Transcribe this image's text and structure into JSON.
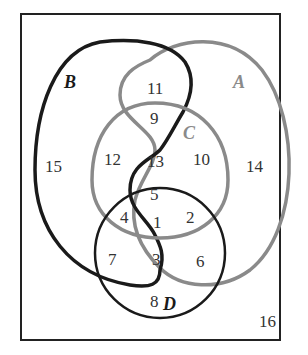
{
  "diagram": {
    "type": "four-set-venn",
    "sets": [
      {
        "name": "A",
        "color": "#8a8a8a"
      },
      {
        "name": "B",
        "color": "#1a1a1a"
      },
      {
        "name": "C",
        "color": "#8a8a8a"
      },
      {
        "name": "D",
        "color": "#1a1a1a"
      }
    ],
    "regions": [
      {
        "label": "1",
        "sets": "A B C D"
      },
      {
        "label": "2",
        "sets": "A C D"
      },
      {
        "label": "3",
        "sets": "A B D"
      },
      {
        "label": "4",
        "sets": "B C D"
      },
      {
        "label": "5",
        "sets": "A B C"
      },
      {
        "label": "6",
        "sets": "A D"
      },
      {
        "label": "7",
        "sets": "B D"
      },
      {
        "label": "8",
        "sets": "D"
      },
      {
        "label": "9",
        "sets": "A B C"
      },
      {
        "label": "10",
        "sets": "A C"
      },
      {
        "label": "11",
        "sets": "A B"
      },
      {
        "label": "12",
        "sets": "B C"
      },
      {
        "label": "13",
        "sets": "B C"
      },
      {
        "label": "14",
        "sets": "A"
      },
      {
        "label": "15",
        "sets": "B"
      },
      {
        "label": "16",
        "sets": "none"
      }
    ]
  },
  "labels": {
    "A": "A",
    "B": "B",
    "C": "C",
    "D": "D",
    "r1": "1",
    "r2": "2",
    "r3": "3",
    "r4": "4",
    "r5": "5",
    "r6": "6",
    "r7": "7",
    "r8": "8",
    "r9": "9",
    "r10": "10",
    "r11": "11",
    "r12": "12",
    "r13": "13",
    "r14": "14",
    "r15": "15",
    "r16": "16"
  },
  "colors": {
    "dark_curve": "#1a1a1a",
    "gray_curve": "#8a8a8a",
    "frame": "#222222",
    "text": "#333333"
  }
}
